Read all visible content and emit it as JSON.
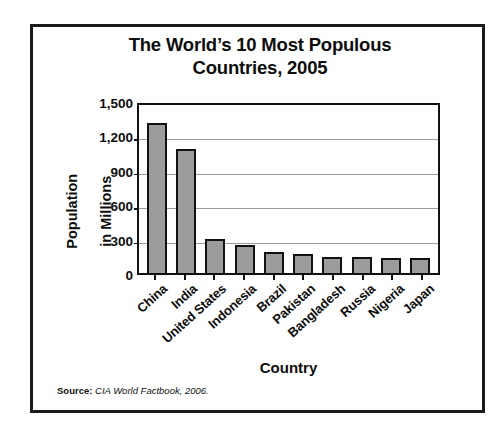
{
  "chart_data": {
    "type": "bar",
    "title": "The World’s 10 Most Populous Countries, 2005",
    "title_line1": "The World’s 10 Most Populous",
    "title_line2": "Countries, 2005",
    "xlabel": "Country",
    "ylabel": "Population in Millions",
    "ylabel_line1": "Population",
    "ylabel_line2": "in Millions",
    "categories": [
      "China",
      "India",
      "United States",
      "Indonesia",
      "Brazil",
      "Pakistan",
      "Bangladesh",
      "Russia",
      "Nigeria",
      "Japan"
    ],
    "values": [
      1306,
      1080,
      296,
      242,
      186,
      162,
      144,
      143,
      129,
      127
    ],
    "ylim": [
      0,
      1500
    ],
    "yticks": [
      0,
      300,
      600,
      900,
      1200,
      1500
    ],
    "ytick_labels": [
      "0",
      "300",
      "600",
      "900",
      "1,200",
      "1,500"
    ],
    "grid": true,
    "legend": "none",
    "bar_color": "#9c9c9c",
    "bar_edge_color": "#111111",
    "gridline_color": "#9d9d9d",
    "axis_color": "#111111",
    "text_color": "#0d0d0d"
  },
  "source": {
    "label": "Source:",
    "text": "CIA World Factbook, 2006."
  }
}
